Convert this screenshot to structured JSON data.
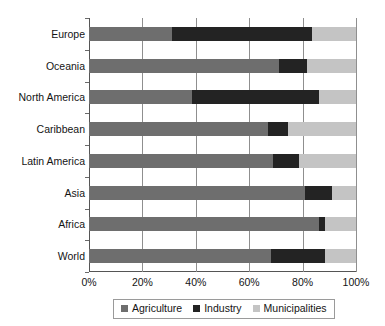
{
  "chart_data": {
    "type": "bar",
    "orientation": "horizontal",
    "stacked": true,
    "normalized_percent": true,
    "title": "",
    "subtitle": "",
    "xlabel": "",
    "ylabel": "",
    "xlim": [
      0,
      100
    ],
    "xticks": [
      "0%",
      "20%",
      "40%",
      "60%",
      "80%",
      "100%"
    ],
    "xtick_values": [
      0,
      20,
      40,
      60,
      80,
      100
    ],
    "grid": "vertical",
    "legend_position": "bottom",
    "categories": [
      "Europe",
      "Oceania",
      "North America",
      "Caribbean",
      "Latin America",
      "Asia",
      "Africa",
      "World"
    ],
    "series": [
      {
        "name": "Agriculture",
        "color": "#6e6e6e",
        "values": [
          31,
          71,
          38.5,
          67,
          69,
          81,
          86,
          68
        ]
      },
      {
        "name": "Industry",
        "color": "#232323",
        "values": [
          52.5,
          10.5,
          47.5,
          7.5,
          9.5,
          10,
          2.5,
          20.5
        ]
      },
      {
        "name": "Municipalities",
        "color": "#c4c4c4",
        "values": [
          16.5,
          18.5,
          14,
          25.5,
          21.5,
          9,
          11.5,
          11.5
        ]
      }
    ],
    "legend": [
      {
        "label": "Agriculture",
        "color": "#6e6e6e"
      },
      {
        "label": "Industry",
        "color": "#232323"
      },
      {
        "label": "Municipalities",
        "color": "#c4c4c4"
      }
    ]
  },
  "axis": {
    "tick_0": "0%",
    "tick_1": "20%",
    "tick_2": "40%",
    "tick_3": "60%",
    "tick_4": "80%",
    "tick_5": "100%"
  },
  "category_labels": {
    "c0": "Europe",
    "c1": "Oceania",
    "c2": "North America",
    "c3": "Caribbean",
    "c4": "Latin America",
    "c5": "Asia",
    "c6": "Africa",
    "c7": "World"
  },
  "legend_labels": {
    "l0": "Agriculture",
    "l1": "Industry",
    "l2": "Municipalities"
  },
  "colors": {
    "agriculture": "#6e6e6e",
    "industry": "#232323",
    "municipalities": "#c4c4c4",
    "gridline": "#8f8f8f",
    "axis": "#555555",
    "text": "#141414",
    "background": "#ffffff"
  }
}
